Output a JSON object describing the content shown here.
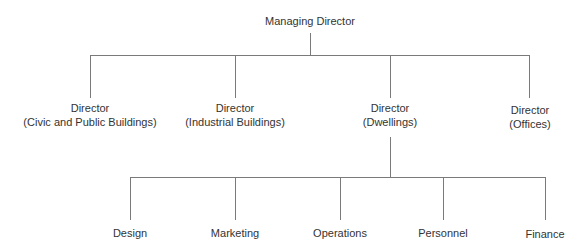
{
  "diagram": {
    "type": "org-chart",
    "colors": {
      "text": "#333333",
      "line": "#7a7a7a",
      "background": "#ffffff"
    },
    "root": {
      "id": "md",
      "label": "Managing Director",
      "x": 310,
      "y": 14
    },
    "level1": [
      {
        "id": "d1",
        "line1": "Director",
        "line2": "(Civic and Public Buildings)",
        "x": 90,
        "y": 101
      },
      {
        "id": "d2",
        "line1": "Director",
        "line2": "(Industrial Buildings)",
        "x": 235,
        "y": 101
      },
      {
        "id": "d3",
        "line1": "Director",
        "line2": "(Dwellings)",
        "x": 390,
        "y": 101
      },
      {
        "id": "d4",
        "line1": "Director",
        "line2": "(Offices)",
        "x": 530,
        "y": 103
      }
    ],
    "level2_parent": "d3",
    "level2": [
      {
        "id": "design",
        "label": "Design",
        "x": 130
      },
      {
        "id": "marketing",
        "label": "Marketing",
        "x": 235
      },
      {
        "id": "operations",
        "label": "Operations",
        "x": 340
      },
      {
        "id": "personnel",
        "label": "Personnel",
        "x": 443
      },
      {
        "id": "finance",
        "label": "Finance",
        "x": 545
      }
    ]
  }
}
